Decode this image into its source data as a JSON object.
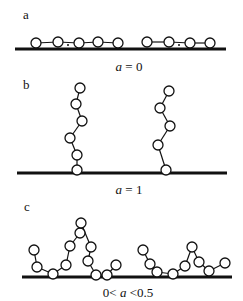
{
  "panels": [
    {
      "id": "a",
      "label": "a",
      "caption_prefix": "",
      "caption_var": "a",
      "caption_suffix": " = 0",
      "baseline": {
        "x1": 15,
        "x2": 226,
        "y": 49
      },
      "chains": [
        {
          "beads": [
            [
              36,
              43
            ],
            [
              58,
              42
            ],
            [
              79,
              43
            ],
            [
              98,
              42
            ],
            [
              118,
              43
            ]
          ],
          "dots": [
            [
              68,
              45
            ]
          ]
        },
        {
          "beads": [
            [
              147,
              42
            ],
            [
              169,
              42
            ],
            [
              190,
              43
            ],
            [
              210,
              43
            ]
          ],
          "dots": [
            [
              179,
              45
            ]
          ]
        }
      ]
    },
    {
      "id": "b",
      "label": "b",
      "caption_prefix": "",
      "caption_var": "a",
      "caption_suffix": " = 1",
      "baseline": {
        "x1": 17,
        "x2": 227,
        "y": 173
      },
      "chains": [
        {
          "beads": [
            [
              77,
              170
            ],
            [
              77,
              155
            ],
            [
              70,
              138
            ],
            [
              82,
              121
            ],
            [
              76,
              104
            ],
            [
              80,
              88
            ]
          ],
          "dots": []
        },
        {
          "beads": [
            [
              166,
              170
            ],
            [
              158,
              145
            ],
            [
              170,
              126
            ],
            [
              160,
              108
            ],
            [
              169,
              91
            ]
          ],
          "dots": []
        }
      ]
    },
    {
      "id": "c",
      "label": "c",
      "caption_prefix": "0< ",
      "caption_var": "a",
      "caption_suffix": " <0.5",
      "baseline": {
        "x1": 22,
        "x2": 232,
        "y": 277
      },
      "chains": [
        {
          "beads": [
            [
              34,
              250
            ],
            [
              37,
              267
            ],
            [
              53,
              274
            ],
            [
              66,
              265
            ],
            [
              70,
              246
            ],
            [
              80,
              233
            ],
            [
              81,
              223
            ],
            [
              91,
              247
            ],
            [
              88,
              261
            ],
            [
              96,
              275
            ],
            [
              107,
              275
            ],
            [
              116,
              265
            ]
          ],
          "dots": []
        },
        {
          "beads": [
            [
              143,
              250
            ],
            [
              150,
              264
            ],
            [
              157,
              272
            ],
            [
              173,
              274
            ],
            [
              185,
              266
            ],
            [
              192,
              247
            ],
            [
              199,
              262
            ],
            [
              209,
              271
            ],
            [
              225,
              263
            ]
          ],
          "dots": []
        }
      ]
    }
  ],
  "style": {
    "bead_radius": 5,
    "line_color": "#111111",
    "bead_fill": "#ffffff"
  }
}
